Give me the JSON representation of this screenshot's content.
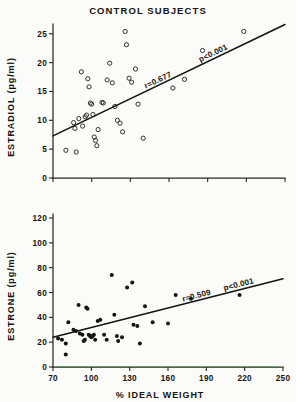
{
  "figure": {
    "background": "#fbfbf9",
    "ink": "#15130f"
  },
  "top_chart": {
    "title": "CONTROL SUBJECTS",
    "ylabel": "ESTRADIOL (pg/ml)",
    "annotation_r": "r=0.677",
    "annotation_p": "p<0.001",
    "yticks": [
      "0",
      "5",
      "10",
      "15",
      "20",
      "25"
    ]
  },
  "bottom_chart": {
    "ylabel": "ESTRONE (pg/ml)",
    "xlabel": "% IDEAL WEIGHT",
    "annotation_r": "r=0.509",
    "annotation_p": "p<0.001",
    "yticks": [
      "0",
      "20",
      "40",
      "60",
      "80",
      "100",
      "120"
    ],
    "xticks": [
      "70",
      "100",
      "130",
      "160",
      "190",
      "220",
      "250"
    ]
  },
  "chart_data": [
    {
      "type": "scatter",
      "title": "CONTROL SUBJECTS",
      "xlabel": "% IDEAL WEIGHT",
      "ylabel": "ESTRADIOL (pg/ml)",
      "xlim": [
        70,
        250
      ],
      "ylim": [
        0,
        26
      ],
      "xticks": [
        70,
        100,
        130,
        160,
        190,
        220,
        250
      ],
      "xticklabels_visible": false,
      "yticks": [
        0,
        5,
        10,
        15,
        20,
        25
      ],
      "grid": false,
      "marker": "open-circle",
      "legend": "none",
      "annotations": [
        "r=0.677",
        "p<0.001"
      ],
      "statistics": {
        "r": 0.677,
        "p": "<0.001",
        "n": 41
      },
      "regression_line": {
        "x": [
          70,
          250
        ],
        "y": [
          7.3,
          26.6
        ]
      },
      "points": [
        {
          "x": 80,
          "y": 4.8
        },
        {
          "x": 88,
          "y": 4.5
        },
        {
          "x": 86,
          "y": 9.6
        },
        {
          "x": 87,
          "y": 8.6
        },
        {
          "x": 90,
          "y": 10.3
        },
        {
          "x": 92,
          "y": 18.4
        },
        {
          "x": 93,
          "y": 9.0
        },
        {
          "x": 95,
          "y": 10.6
        },
        {
          "x": 96,
          "y": 10.9
        },
        {
          "x": 97,
          "y": 17.2
        },
        {
          "x": 98,
          "y": 15.8
        },
        {
          "x": 99,
          "y": 13.0
        },
        {
          "x": 100,
          "y": 12.8
        },
        {
          "x": 101,
          "y": 11.0
        },
        {
          "x": 102,
          "y": 7.1
        },
        {
          "x": 103,
          "y": 6.5
        },
        {
          "x": 104,
          "y": 5.6
        },
        {
          "x": 105,
          "y": 8.4
        },
        {
          "x": 108,
          "y": 13.1
        },
        {
          "x": 109,
          "y": 13.0
        },
        {
          "x": 112,
          "y": 17.0
        },
        {
          "x": 114,
          "y": 19.9
        },
        {
          "x": 116,
          "y": 16.5
        },
        {
          "x": 118,
          "y": 12.4
        },
        {
          "x": 120,
          "y": 10.0
        },
        {
          "x": 122,
          "y": 9.5
        },
        {
          "x": 124,
          "y": 8.0
        },
        {
          "x": 126,
          "y": 25.4
        },
        {
          "x": 127,
          "y": 23.1
        },
        {
          "x": 129,
          "y": 17.3
        },
        {
          "x": 131,
          "y": 16.6
        },
        {
          "x": 134,
          "y": 18.9
        },
        {
          "x": 136,
          "y": 12.8
        },
        {
          "x": 140,
          "y": 6.9
        },
        {
          "x": 163,
          "y": 15.6
        },
        {
          "x": 172,
          "y": 17.1
        },
        {
          "x": 186,
          "y": 22.1
        },
        {
          "x": 218,
          "y": 25.4
        }
      ]
    },
    {
      "type": "scatter",
      "title": "",
      "xlabel": "% IDEAL WEIGHT",
      "ylabel": "ESTRONE (pg/ml)",
      "xlim": [
        70,
        250
      ],
      "ylim": [
        0,
        120
      ],
      "xticks": [
        70,
        100,
        130,
        160,
        190,
        220,
        250
      ],
      "yticks": [
        0,
        20,
        40,
        60,
        80,
        100,
        120
      ],
      "grid": false,
      "marker": "filled-circle",
      "legend": "none",
      "annotations": [
        "r=0.509",
        "p<0.001"
      ],
      "statistics": {
        "r": 0.509,
        "p": "<0.001",
        "n": 40
      },
      "regression_line": {
        "x": [
          70,
          250
        ],
        "y": [
          24,
          71
        ]
      },
      "points": [
        {
          "x": 74,
          "y": 23
        },
        {
          "x": 77,
          "y": 22
        },
        {
          "x": 80,
          "y": 19
        },
        {
          "x": 80,
          "y": 10
        },
        {
          "x": 82,
          "y": 36
        },
        {
          "x": 86,
          "y": 30
        },
        {
          "x": 88,
          "y": 29
        },
        {
          "x": 90,
          "y": 50
        },
        {
          "x": 91,
          "y": 27
        },
        {
          "x": 93,
          "y": 26
        },
        {
          "x": 94,
          "y": 21
        },
        {
          "x": 95,
          "y": 22
        },
        {
          "x": 96,
          "y": 48
        },
        {
          "x": 97,
          "y": 47
        },
        {
          "x": 98,
          "y": 26
        },
        {
          "x": 99,
          "y": 25
        },
        {
          "x": 100,
          "y": 24
        },
        {
          "x": 101,
          "y": 25
        },
        {
          "x": 102,
          "y": 26
        },
        {
          "x": 103,
          "y": 22
        },
        {
          "x": 105,
          "y": 37
        },
        {
          "x": 107,
          "y": 38
        },
        {
          "x": 110,
          "y": 26
        },
        {
          "x": 112,
          "y": 22
        },
        {
          "x": 116,
          "y": 74
        },
        {
          "x": 118,
          "y": 42
        },
        {
          "x": 120,
          "y": 25
        },
        {
          "x": 121,
          "y": 21
        },
        {
          "x": 124,
          "y": 24
        },
        {
          "x": 128,
          "y": 64
        },
        {
          "x": 132,
          "y": 68
        },
        {
          "x": 133,
          "y": 34
        },
        {
          "x": 136,
          "y": 33
        },
        {
          "x": 138,
          "y": 19
        },
        {
          "x": 142,
          "y": 49
        },
        {
          "x": 148,
          "y": 36
        },
        {
          "x": 160,
          "y": 35
        },
        {
          "x": 166,
          "y": 58
        },
        {
          "x": 178,
          "y": 55
        },
        {
          "x": 216,
          "y": 58
        }
      ]
    }
  ]
}
